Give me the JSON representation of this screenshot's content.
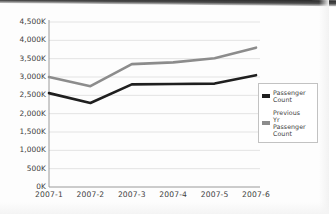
{
  "chart_data": {
    "type": "line",
    "title": "",
    "xlabel": "",
    "ylabel": "",
    "categories": [
      "2007-1",
      "2007-2",
      "2007-3",
      "2007-4",
      "2007-5",
      "2007-6"
    ],
    "series": [
      {
        "name": "Passenger Count",
        "legend_label": "Passenger\nCount",
        "color": "#1f1f1f",
        "values": [
          2560,
          2290,
          2800,
          2810,
          2820,
          3050
        ]
      },
      {
        "name": "Previous Yr Passenger Count",
        "legend_label": "Previous\nYr\nPassenger\nCount",
        "color": "#8c8c8c",
        "values": [
          3000,
          2750,
          3350,
          3400,
          3510,
          3800
        ]
      }
    ],
    "units": "K",
    "ylim": [
      0,
      4500
    ],
    "ytick_values": [
      0,
      500,
      1000,
      1500,
      2000,
      2500,
      3000,
      3500,
      4000,
      4500
    ],
    "ytick_labels": [
      "0K",
      "500K",
      "1,000K",
      "1,500K",
      "2,000K",
      "2,500K",
      "3,000K",
      "3,500K",
      "4,000K",
      "4,500K"
    ],
    "grid": true,
    "grid_color": "#dcdcdc",
    "axis_color": "#9a9a9a",
    "legend_position": "right",
    "background": "#ffffff"
  },
  "legend": {
    "items": [
      {
        "label": "Passenger\nCount",
        "color": "#1f1f1f"
      },
      {
        "label": "Previous\nYr\nPassenger\nCount",
        "color": "#8c8c8c"
      }
    ]
  }
}
